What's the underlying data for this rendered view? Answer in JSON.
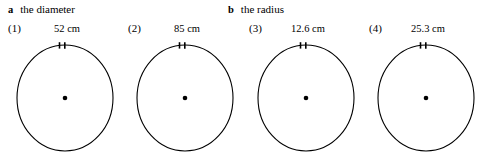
{
  "sections": [
    {
      "letter": "a",
      "title": "the diameter"
    },
    {
      "letter": "b",
      "title": "the radius"
    }
  ],
  "figures": [
    {
      "number": "(1)",
      "measure": "52 cm"
    },
    {
      "number": "(2)",
      "measure": "85 cm"
    },
    {
      "number": "(3)",
      "measure": "12.6 cm"
    },
    {
      "number": "(4)",
      "measure": "25.3 cm"
    }
  ],
  "colors": {
    "ink": "#000000",
    "background": "#ffffff"
  }
}
